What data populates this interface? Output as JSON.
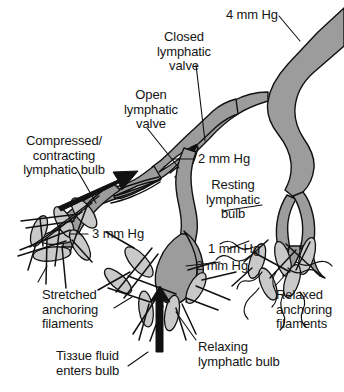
{
  "figure": {
    "colors": {
      "vessel_gray": "#9c9c9c",
      "bulb_gray": "#c9c9c9",
      "outline_black": "#111111",
      "background": "#ffffff"
    }
  },
  "labels": {
    "pressure_4": "4 mm Hg",
    "closed_valve": "Closed\nlymphatic\nvalve",
    "open_valve": "Open\nlymphatic\nvalve",
    "compressed_bulb": "Compressed/\ncontracting\nlymphatic bulb",
    "pressure_2_mid": "2 mm Hg",
    "resting_bulb": "Resting\nlymphatic\nbulb",
    "pressure_3": "3 mm Hg",
    "pressure_1": "1 mm Hg",
    "pressure_neg2": "2 mm Hg",
    "stretched_filaments": "Stretched\nanchoring\nfilaments",
    "relaxed_filaments": "Relaxed\nanchoring\nfilaments",
    "relaxing_bulb": "Relaxing\nlymphatlc bulb",
    "tissue_fluid": "Tiззue fluid\nenters bulb"
  },
  "annotations": {
    "pressures": [
      {
        "value": "4 mm Hg",
        "location": "main collecting trunk, upper right"
      },
      {
        "value": "2 mm Hg",
        "location": "vessel above open valve, middle"
      },
      {
        "value": "3 mm Hg",
        "location": "left contracting branch"
      },
      {
        "value": "1 mm Hg",
        "location": "right resting branch"
      },
      {
        "value": "2 mm Hg",
        "location": "lower middle, relaxing bulb"
      }
    ]
  }
}
